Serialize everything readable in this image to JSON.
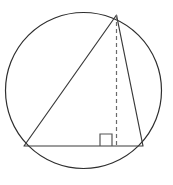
{
  "figure": {
    "canvas": {
      "width": 173,
      "height": 185,
      "background": "#ffffff"
    },
    "colors": {
      "stroke": "#3a3a3a",
      "circle_stroke": "#2e2e2e",
      "dashed_stroke": "#6b6b6b",
      "right_angle_stroke": "#555555",
      "background": "#ffffff"
    },
    "circle": {
      "name": "circumscribed-circle",
      "cx": 83.5,
      "cy": 90.5,
      "r": 78.0,
      "stroke_width": 1.2,
      "fill": "none"
    },
    "triangle": {
      "name": "inscribed-triangle",
      "stroke_width": 1.2,
      "fill": "none",
      "vertices": [
        {
          "label": "apex",
          "x": 116.5,
          "y": 15.0
        },
        {
          "label": "base-left",
          "x": 24.0,
          "y": 146.0
        },
        {
          "label": "base-right",
          "x": 143.0,
          "y": 146.0
        }
      ],
      "points_attr": "116.5,15 24,146 143,146",
      "sides": [
        {
          "name": "left-side",
          "x1": 116.5,
          "y1": 15.0,
          "x2": 24.0,
          "y2": 146.0
        },
        {
          "name": "base-side",
          "x1": 24.0,
          "y1": 146.0,
          "x2": 143.0,
          "y2": 146.0
        },
        {
          "name": "right-side",
          "x1": 143.0,
          "y1": 146.0,
          "x2": 116.5,
          "y2": 15.0
        }
      ]
    },
    "altitude": {
      "name": "altitude-dashed-line",
      "x1": 116.5,
      "y1": 15.0,
      "x2": 116.5,
      "y2": 146.0,
      "stroke_width": 1.2,
      "dash_pattern": "4,3"
    },
    "right_angle_marker": {
      "name": "right-angle-square",
      "path": "M 100 146 L 100 134 L 112 134 L 112 146",
      "size": 12,
      "stroke_width": 1.2,
      "fill": "none"
    }
  }
}
